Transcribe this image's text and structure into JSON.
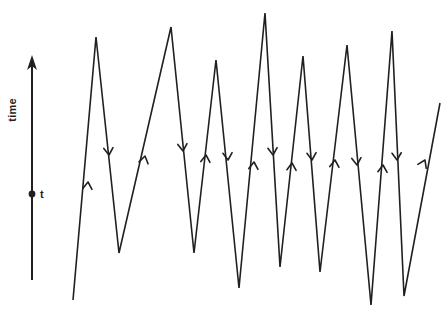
{
  "figure": {
    "kind": "zigzag-time-diagram",
    "background_color": "#ffffff",
    "ink_color": "#231f20",
    "axis": {
      "label": "time",
      "orientation": "vertical",
      "arrow_direction": "up",
      "tick_label": "t",
      "tick_marker": "filled-dot"
    }
  },
  "chart_data": {
    "type": "line",
    "title": "",
    "xlabel": "",
    "ylabel": "time",
    "grid": false,
    "legend": null,
    "axis_arrow": "up",
    "marked_point_label": "t",
    "series": [
      {
        "name": "zigzag-path",
        "points": [
          [
            73,
            300
          ],
          [
            96,
            37
          ],
          [
            119,
            253
          ],
          [
            171,
            27
          ],
          [
            194,
            253
          ],
          [
            216,
            60
          ],
          [
            239,
            288
          ],
          [
            265,
            13
          ],
          [
            280,
            267
          ],
          [
            303,
            56
          ],
          [
            320,
            272
          ],
          [
            347,
            45
          ],
          [
            371,
            305
          ],
          [
            392,
            31
          ],
          [
            404,
            296
          ],
          [
            440,
            103
          ]
        ]
      }
    ],
    "peaks_x": [
      96,
      171,
      216,
      265,
      303,
      347,
      392
    ],
    "peaks_y": [
      37,
      27,
      60,
      13,
      56,
      45,
      31
    ],
    "valleys_x": [
      119,
      194,
      239,
      280,
      320,
      371,
      404
    ],
    "valleys_y": [
      253,
      253,
      288,
      267,
      272,
      305,
      296
    ],
    "segment_directions": [
      "up",
      "down",
      "up",
      "down",
      "up",
      "down",
      "up",
      "down",
      "up",
      "down",
      "up",
      "down",
      "up",
      "down",
      "up"
    ]
  },
  "arrow_markers": [
    {
      "name": "segment-arrow-up-1",
      "x": 88,
      "y": 182,
      "dir": "up",
      "angle": 5
    },
    {
      "name": "segment-arrow-down-1",
      "x": 109,
      "y": 155,
      "dir": "down",
      "angle": -5
    },
    {
      "name": "segment-arrow-up-2",
      "x": 145,
      "y": 156,
      "dir": "up",
      "angle": 12
    },
    {
      "name": "segment-arrow-down-2",
      "x": 183,
      "y": 151,
      "dir": "down",
      "angle": -5
    },
    {
      "name": "segment-arrow-up-3",
      "x": 206,
      "y": 155,
      "dir": "up",
      "angle": 5
    },
    {
      "name": "segment-arrow-down-3",
      "x": 228,
      "y": 160,
      "dir": "down",
      "angle": -4
    },
    {
      "name": "segment-arrow-up-4",
      "x": 254,
      "y": 162,
      "dir": "up",
      "angle": 5
    },
    {
      "name": "segment-arrow-down-4",
      "x": 273,
      "y": 155,
      "dir": "down",
      "angle": -4
    },
    {
      "name": "segment-arrow-up-5",
      "x": 292,
      "y": 163,
      "dir": "up",
      "angle": 4
    },
    {
      "name": "segment-arrow-down-5",
      "x": 312,
      "y": 160,
      "dir": "down",
      "angle": -4
    },
    {
      "name": "segment-arrow-up-6",
      "x": 335,
      "y": 160,
      "dir": "up",
      "angle": 5
    },
    {
      "name": "segment-arrow-down-6",
      "x": 357,
      "y": 165,
      "dir": "down",
      "angle": -5
    },
    {
      "name": "segment-arrow-up-7",
      "x": 383,
      "y": 165,
      "dir": "up",
      "angle": 4
    },
    {
      "name": "segment-arrow-down-7",
      "x": 397,
      "y": 160,
      "dir": "down",
      "angle": -3
    },
    {
      "name": "segment-arrow-up-8",
      "x": 425,
      "y": 160,
      "dir": "up",
      "angle": 25
    }
  ],
  "axis_geometry": {
    "x": 32,
    "top_y": 60,
    "bottom_y": 280,
    "dot_y": 194,
    "label_x": 16,
    "label_y": 110,
    "tick_label_x": 40,
    "tick_label_y": 198
  }
}
